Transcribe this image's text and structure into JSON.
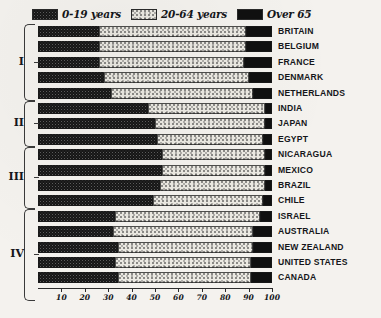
{
  "legend": {
    "items": [
      {
        "label": "0-19 years",
        "pattern": "dark-cross-hatch",
        "color": "#5d5d5d"
      },
      {
        "label": "20-64 years",
        "pattern": "light-stipple",
        "color": "#ebe9e2"
      },
      {
        "label": "Over 65",
        "pattern": "solid-black",
        "color": "#101010"
      }
    ]
  },
  "groups": [
    {
      "label": "I",
      "rows": 5
    },
    {
      "label": "II",
      "rows": 3
    },
    {
      "label": "III",
      "rows": 4
    },
    {
      "label": "IV",
      "rows": 6
    }
  ],
  "axis": {
    "ticks": [
      "10",
      "20",
      "30",
      "40",
      "50",
      "60",
      "70",
      "80",
      "90",
      "100"
    ],
    "min": 0,
    "max": 100
  },
  "chart_data": {
    "type": "bar",
    "orientation": "horizontal",
    "stacked": true,
    "title": "",
    "xlabel": "",
    "ylabel": "",
    "xlim": [
      0,
      100
    ],
    "grid": false,
    "legend_position": "top",
    "categories": [
      "BRITAIN",
      "BELGIUM",
      "FRANCE",
      "DENMARK",
      "NETHERLANDS",
      "INDIA",
      "JAPAN",
      "EGYPT",
      "NICARAGUA",
      "MEXICO",
      "BRAZIL",
      "CHILE",
      "ISRAEL",
      "AUSTRALIA",
      "NEW ZEALAND",
      "UNITED STATES",
      "CANADA"
    ],
    "series": [
      {
        "name": "0-19 years",
        "values": [
          26,
          26,
          26,
          28,
          31,
          47,
          50,
          51,
          53,
          53,
          52,
          49,
          33,
          32,
          34,
          33,
          34
        ]
      },
      {
        "name": "20-64 years",
        "values": [
          63,
          63,
          62,
          62,
          61,
          50,
          47,
          45,
          44,
          44,
          45,
          47,
          62,
          60,
          58,
          58,
          57
        ]
      },
      {
        "name": "Over 65",
        "values": [
          11,
          11,
          12,
          10,
          8,
          3,
          3,
          4,
          3,
          3,
          3,
          4,
          5,
          8,
          8,
          9,
          9
        ]
      }
    ]
  }
}
